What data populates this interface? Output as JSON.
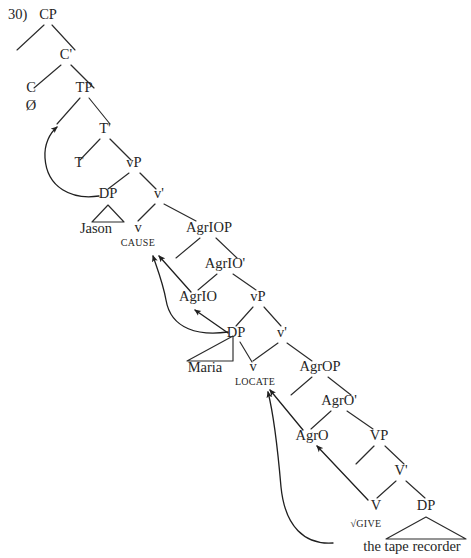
{
  "figure": {
    "example_number": "30)",
    "type": "syntactic-tree",
    "root_label": "CP"
  },
  "nodes": {
    "cp": "CP",
    "cbar": "C'",
    "c": "C",
    "c_terminal": "Ø",
    "tp": "TP",
    "tbar": "T'",
    "t": "T",
    "vp_upper": "vP",
    "dp_subject": "DP",
    "dp_subject_terminal": "Jason",
    "vbar_upper": "v'",
    "v_upper": "v",
    "v_upper_terminal": "CAUSE",
    "agriop": "AgrIOP",
    "agriobar": "AgrIO'",
    "agrio": "AgrIO",
    "vp_lower": "vP",
    "dp_indirect": "DP",
    "dp_indirect_terminal": "Maria",
    "vbar_lower": "v'",
    "v_lower": "v",
    "v_lower_terminal": "LOCATE",
    "agrop": "AgrOP",
    "agrobar": "AgrO'",
    "agro": "AgrO",
    "vp_main": "VP",
    "vbar_main": "V'",
    "v_main": "V",
    "v_main_terminal": "√GIVE",
    "dp_object": "DP",
    "dp_object_terminal": "the tape recorder"
  },
  "movements": [
    {
      "name": "subject-raising-to-spec-tp",
      "from": "DP Jason",
      "to": "Spec,TP"
    },
    {
      "name": "agrio-head-to-v",
      "from": "AgrIO",
      "to": "v CAUSE"
    },
    {
      "name": "maria-raising-to-spec-agriop",
      "from": "DP Maria",
      "to": "Spec,AgrIOP"
    },
    {
      "name": "dp-maria-to-agrio",
      "from": "DP Maria",
      "to": "AgrIO"
    },
    {
      "name": "v-head-to-agro",
      "from": "V",
      "to": "AgrO"
    },
    {
      "name": "agro-head-to-v-locate",
      "from": "AgrO",
      "to": "v LOCATE"
    },
    {
      "name": "object-raising-to-spec-agrop",
      "from": "DP the tape recorder",
      "to": "Spec,AgrOP"
    }
  ],
  "colors": {
    "background": "#ffffff",
    "ink": "#262626",
    "line": "#2b2b2b"
  }
}
